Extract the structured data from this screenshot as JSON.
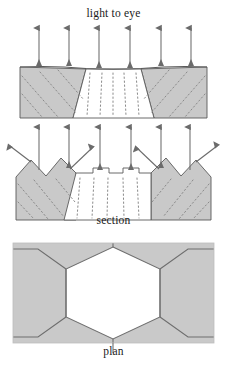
{
  "figure": {
    "title_top": "light to eye",
    "caption_section": "section",
    "caption_plan": "plan",
    "colors": {
      "background": "#ffffff",
      "solid_fill": "#c9c9c9",
      "void_fill": "#ffffff",
      "outline": "#5a5a5a",
      "plan_outline": "#6e6e6e",
      "ray_stroke": "#6b6b6b",
      "dotted_stroke": "#8a8a8a",
      "text": "#1a1a1a"
    },
    "panels": [
      {
        "id": "panel-top",
        "role": "section-flat-surface",
        "label": "light to eye",
        "description": "Vertical light rays striking a flat-bottomed trough; grey solid on both sides, white void in centre, dotted internal structure lines."
      },
      {
        "id": "panel-mid",
        "role": "section-sawtooth-surface",
        "label": "section",
        "description": "Vertical light rays striking a sawtooth surface; oblique reflected rays leave at an angle on both flanks."
      },
      {
        "id": "panel-plan",
        "role": "plan-hexagon",
        "label": "plan",
        "description": "Plan view: central white hexagonal cell bounded by grey surrounding cells."
      }
    ],
    "rays": {
      "incident_label": "incident vertical ray",
      "incident_count_top": 6,
      "incident_count_mid": 6,
      "reflected_count_mid": 4,
      "direction": "up"
    },
    "plan": {
      "centre_cell": "hexagon",
      "centre_cell_fill": "void",
      "surrounding_fill": "solid"
    }
  }
}
